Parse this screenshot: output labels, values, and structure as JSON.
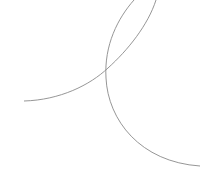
{
  "canvas": {
    "width": 200,
    "height": 188,
    "background": "#ffffff"
  },
  "curves": [
    {
      "name": "curve-a",
      "color": "#8a8a8a",
      "d": "M24,101 C60,100 90,85 108,68 C128,50 148,25 156,0"
    },
    {
      "name": "curve-b",
      "color": "#8a8a8a",
      "d": "M134,0 C118,18 104,45 106,78 C108,120 140,162 200,166"
    }
  ]
}
